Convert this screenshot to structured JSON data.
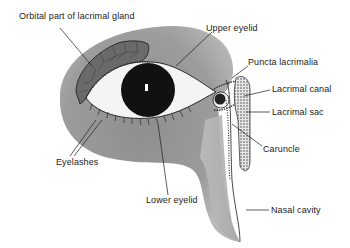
{
  "diagram": {
    "colors": {
      "face": "#9a9a9a",
      "face_light": "#c2c2c2",
      "gland": "#6e6e6e",
      "sclera": "#f4f4f4",
      "iris": "#111111",
      "line": "#1a1a1a",
      "background": "#ffffff"
    },
    "labels": [
      {
        "id": "orbital-part-lacrimal-gland",
        "text": "Orbital part of lacrimal gland",
        "x": 19,
        "y": 17
      },
      {
        "id": "upper-eyelid",
        "text": "Upper eyelid",
        "x": 206,
        "y": 25
      },
      {
        "id": "puncta-lacrimalia",
        "text": "Puncta lacrimalia",
        "x": 248,
        "y": 60
      },
      {
        "id": "lacrimal-canal",
        "text": "Lacrimal canal",
        "x": 271,
        "y": 86
      },
      {
        "id": "lacrimal-sac",
        "text": "Lacrimal sac",
        "x": 272,
        "y": 108
      },
      {
        "id": "caruncle",
        "text": "Caruncle",
        "x": 263,
        "y": 146
      },
      {
        "id": "eyelashes",
        "text": "Eyelashes",
        "x": 56,
        "y": 157
      },
      {
        "id": "lower-eyelid",
        "text": "Lower eyelid",
        "x": 146,
        "y": 195
      },
      {
        "id": "nasal-cavity",
        "text": "Nasal cavity",
        "x": 271,
        "y": 207
      }
    ]
  }
}
